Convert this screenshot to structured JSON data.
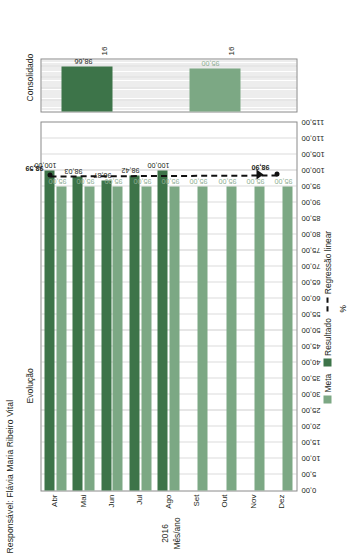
{
  "header": {
    "responsible": "Responsável: Flávia Maria Ribeiro Vital"
  },
  "panels": {
    "evolucao_title": "Evolução",
    "consolidado_title": "Consolidado"
  },
  "axis": {
    "value_title": "%",
    "category_title": "Mês/ano",
    "year": "2016"
  },
  "legend": {
    "meta": "Meta",
    "resultado": "Resultado",
    "regressao": "Regressão linear"
  },
  "colors": {
    "meta": "#7ca884",
    "resultado": "#3d7449",
    "regression": "#111111",
    "frame": "#8a8a8a",
    "grid": "#b9b9b9"
  },
  "chart_data": {
    "type": "bar",
    "title": "Evolução",
    "subtitle": "Responsável: Flávia Maria Ribeiro Vital",
    "orientation": "horizontal-rotated",
    "xlabel": "Mês/ano",
    "ylabel": "%",
    "ylim": [
      0,
      115
    ],
    "ytick_step": 5,
    "grid": true,
    "legend_position": "bottom",
    "yticks": [
      "0,00",
      "5,00",
      "10,00",
      "15,00",
      "20,00",
      "25,00",
      "30,00",
      "35,00",
      "40,00",
      "45,00",
      "50,00",
      "55,00",
      "60,00",
      "65,00",
      "70,00",
      "75,00",
      "80,00",
      "85,00",
      "90,00",
      "95,00",
      "100,00",
      "105,00",
      "110,00",
      "115,00"
    ],
    "categories": [
      "Abr",
      "Mai",
      "Jun",
      "Jul",
      "Ago",
      "Set",
      "Out",
      "Nov",
      "Dez"
    ],
    "series": [
      {
        "name": "Meta",
        "color": "#7ca884",
        "values": [
          95.0,
          95.0,
          95.0,
          95.0,
          95.0,
          95.0,
          95.0,
          95.0,
          95.0
        ],
        "labels": [
          "95,00",
          "95,00",
          "95,00",
          "95,00",
          "95,00",
          "95,00",
          "95,00",
          "95,00",
          "95,00"
        ]
      },
      {
        "name": "Resultado",
        "color": "#3d7449",
        "values": [
          100.0,
          98.03,
          96.87,
          98.42,
          100.0,
          null,
          null,
          null,
          null
        ],
        "labels": [
          "100,00",
          "98,03",
          "96,87",
          "98,42",
          "100,00",
          "",
          "",
          "",
          ""
        ]
      },
      {
        "name": "Regressão linear",
        "color": "#111111",
        "style": "dashed",
        "endpoints": [
          {
            "category": "Abr",
            "value": 98.59,
            "label": "98,59"
          },
          {
            "category": "Dez",
            "value": 98.9,
            "label": "98,90"
          }
        ]
      }
    ],
    "consolidado": {
      "categories": [
        "16",
        "16"
      ],
      "meta": {
        "value": 95.0,
        "label": "95,00"
      },
      "resultado": {
        "value": 98.66,
        "label": "98,66"
      }
    }
  }
}
